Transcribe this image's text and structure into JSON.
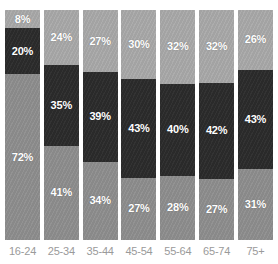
{
  "chart_data": {
    "type": "bar",
    "subtype": "stacked-percentage",
    "title": "",
    "subtitle": "",
    "xlabel": "",
    "ylabel": "",
    "ylim": [
      0,
      100
    ],
    "grid": false,
    "legend": "none",
    "orientation": "vertical",
    "stack_order_top_to_bottom": [
      "light-gray",
      "dark",
      "medium-gray"
    ],
    "categories": [
      "16-24",
      "25-34",
      "35-44",
      "45-54",
      "55-64",
      "65-74",
      "75+"
    ],
    "series": [
      {
        "name": "light-gray",
        "color": "#a8a8a8",
        "position": "top",
        "values": [
          8,
          24,
          27,
          30,
          32,
          32,
          26
        ],
        "labels": [
          "8%",
          "24%",
          "27%",
          "30%",
          "32%",
          "32%",
          "26%"
        ]
      },
      {
        "name": "dark",
        "color": "#2c2c2c",
        "position": "middle",
        "values": [
          20,
          35,
          39,
          43,
          40,
          42,
          43
        ],
        "labels": [
          "20%",
          "35%",
          "39%",
          "43%",
          "40%",
          "42%",
          "43%"
        ]
      },
      {
        "name": "medium-gray",
        "color": "#8d8d8d",
        "position": "bottom",
        "values": [
          72,
          41,
          34,
          27,
          28,
          27,
          31
        ],
        "labels": [
          "72%",
          "41%",
          "34%",
          "27%",
          "28%",
          "27%",
          "31%"
        ]
      }
    ]
  },
  "axis": {
    "tick_labels": [
      "16-24",
      "25-34",
      "35-44",
      "45-54",
      "55-64",
      "65-74",
      "75+"
    ]
  },
  "colors": {
    "top_segment": "#a8a8a8",
    "middle_segment": "#2c2c2c",
    "bottom_segment": "#8d8d8d",
    "label_text": "#ffffff",
    "axis_text": "#9a9a9a",
    "background": "#ffffff"
  }
}
